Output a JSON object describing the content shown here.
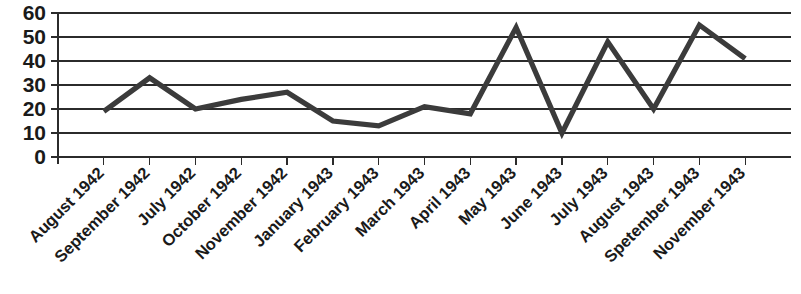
{
  "chart_data": {
    "type": "line",
    "title": "",
    "subtitle": "",
    "xlabel": "",
    "ylabel": "",
    "categories": [
      "August 1942",
      "September 1942",
      "July 1942",
      "October 1942",
      "November 1942",
      "January 1943",
      "February 1943",
      "March 1943",
      "April 1943",
      "May 1943",
      "June 1943",
      "July 1943",
      "August 1943",
      "Spetember 1943",
      "November 1943"
    ],
    "values": [
      19,
      33,
      20,
      24,
      27,
      15,
      13,
      21,
      18,
      54,
      10,
      48,
      20,
      55,
      41
    ],
    "ylim": [
      0,
      60
    ],
    "yticks": [
      0,
      10,
      20,
      30,
      40,
      50,
      60
    ],
    "ytick_labels": [
      "0",
      "10",
      "20",
      "30",
      "40",
      "50",
      "60"
    ],
    "grid": true,
    "grid_axis": "y",
    "legend": false,
    "legend_position": "none",
    "series": [
      {
        "name": "",
        "values": [
          19,
          33,
          20,
          24,
          27,
          15,
          13,
          21,
          18,
          54,
          10,
          48,
          20,
          55,
          41
        ],
        "color": "#3b3b3b"
      }
    ],
    "xtick_label_rotation_deg": -45,
    "annotations": []
  },
  "colors": {
    "line": "#3b3b3b",
    "grid": "#2b2b2b",
    "axis": "#2b2b2b",
    "text": "#1a1a1a",
    "background": "#ffffff"
  }
}
